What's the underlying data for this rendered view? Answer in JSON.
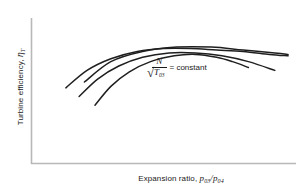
{
  "figure": {
    "background_color": "#ffffff",
    "axis_color": "#b8b8b8",
    "curve_color": "#1f1f1f",
    "text_color": "#1a1a1a"
  },
  "axes": {
    "y_title": {
      "text_plain": "Turbine efficiency, ηT",
      "prefix": "Turbine efficiency, ",
      "symbol": "η",
      "subscript": "T"
    },
    "x_title": {
      "text_plain": "Expansion ratio, p03/p04",
      "prefix": "Expansion ratio, ",
      "numerator_symbol": "p",
      "numerator_subscript": "03",
      "slash": "/",
      "denominator_symbol": "p",
      "denominator_subscript": "04"
    }
  },
  "annotation": {
    "radical": "√",
    "numerator": "N",
    "denominator_symbol": "T",
    "denominator_subscript": "03",
    "equals_text": "= constant",
    "text_plain": "N/√T03 = constant"
  },
  "chart_data": {
    "type": "line",
    "title": "",
    "xlabel": "Expansion ratio, p03/p04",
    "ylabel": "Turbine efficiency, ηT",
    "xlim": [
      0,
      100
    ],
    "ylim": [
      0,
      100
    ],
    "grid": false,
    "legend": "none",
    "axis_ticks": "none",
    "annotations": [
      {
        "text": "N/√T03 = constant",
        "x": 56,
        "y": 62
      }
    ],
    "series": [
      {
        "name": "curve-1",
        "comment": "lowest starting, shortest; rises steeply then falls off mid-right",
        "x": [
          24,
          30,
          37,
          45,
          54,
          62,
          70,
          76,
          82
        ],
        "y": [
          40,
          53,
          63,
          70,
          74,
          75,
          73,
          70,
          66
        ]
      },
      {
        "name": "curve-2",
        "comment": "middle curve, starts higher-left, broad peak, falls to far right",
        "x": [
          18,
          25,
          33,
          42,
          52,
          62,
          72,
          82,
          92
        ],
        "y": [
          46,
          58,
          67,
          73,
          76,
          76,
          74,
          70,
          64
        ]
      },
      {
        "name": "curve-3",
        "comment": "highest/longest, flattest peak, extends to right edge",
        "x": [
          13,
          21,
          30,
          40,
          50,
          60,
          70,
          80,
          90,
          97
        ],
        "y": [
          52,
          64,
          72,
          77,
          79,
          79,
          78,
          77,
          75,
          74
        ]
      },
      {
        "name": "curve-4",
        "comment": "top-most short arc crossing others near centre-right",
        "x": [
          20,
          30,
          42,
          55,
          68,
          80,
          92,
          97
        ],
        "y": [
          56,
          70,
          77,
          80,
          80,
          78,
          76,
          75
        ]
      }
    ]
  }
}
